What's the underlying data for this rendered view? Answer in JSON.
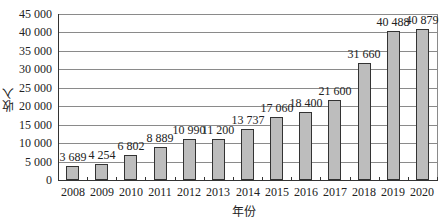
{
  "chart_data": {
    "type": "bar",
    "title": "",
    "xlabel": "年份",
    "ylabel": "收入",
    "categories": [
      "2008",
      "2009",
      "2010",
      "2011",
      "2012",
      "2013",
      "2014",
      "2015",
      "2016",
      "2017",
      "2018",
      "2019",
      "2020"
    ],
    "values": [
      3689,
      4254,
      6802,
      8889,
      10990,
      11200,
      13737,
      17060,
      18400,
      21600,
      31660,
      40488,
      40879
    ],
    "value_labels": [
      "3 689",
      "4 254",
      "6 802",
      "8 889",
      "10 990",
      "11 200",
      "13 737",
      "17 060",
      "18 400",
      "21 600",
      "31 660",
      "40 488",
      "40 879"
    ],
    "ylim": [
      0,
      45000
    ],
    "yticks": [
      0,
      5000,
      10000,
      15000,
      20000,
      25000,
      30000,
      35000,
      40000,
      45000
    ],
    "ytick_labels": [
      "0",
      "5 000",
      "10 000",
      "15 000",
      "20 000",
      "25 000",
      "30 000",
      "35 000",
      "40 000",
      "45 000"
    ],
    "grid": true,
    "legend": null,
    "colors": {
      "bar_fill": "#bdbdbd",
      "bar_edge": "#333333",
      "grid": "#8a8a8a"
    }
  }
}
